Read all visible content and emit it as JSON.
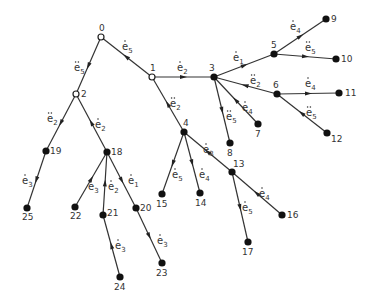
{
  "diagram": {
    "type": "tree",
    "nodes": [
      {
        "id": "0",
        "x": 101,
        "y": 37,
        "open": true,
        "lx": -2,
        "ly": -6
      },
      {
        "id": "1",
        "x": 152,
        "y": 77,
        "open": true,
        "lx": -2,
        "ly": -6
      },
      {
        "id": "2",
        "x": 76,
        "y": 94,
        "open": true,
        "lx": 5,
        "ly": 3
      },
      {
        "id": "3",
        "x": 214,
        "y": 77,
        "open": false,
        "lx": -5,
        "ly": -6
      },
      {
        "id": "4",
        "x": 184,
        "y": 132,
        "open": false,
        "lx": -1,
        "ly": -6
      },
      {
        "id": "5",
        "x": 274,
        "y": 54,
        "open": false,
        "lx": -3,
        "ly": -6
      },
      {
        "id": "6",
        "x": 277,
        "y": 94,
        "open": false,
        "lx": -4,
        "ly": -6
      },
      {
        "id": "7",
        "x": 258,
        "y": 124,
        "open": false,
        "lx": -3,
        "ly": 13
      },
      {
        "id": "8",
        "x": 230,
        "y": 143,
        "open": false,
        "lx": -3,
        "ly": 13
      },
      {
        "id": "9",
        "x": 326,
        "y": 19,
        "open": false,
        "lx": 5,
        "ly": 3
      },
      {
        "id": "10",
        "x": 336,
        "y": 59,
        "open": false,
        "lx": 5,
        "ly": 3
      },
      {
        "id": "11",
        "x": 339,
        "y": 93,
        "open": false,
        "lx": 6,
        "ly": 3
      },
      {
        "id": "12",
        "x": 327,
        "y": 133,
        "open": false,
        "lx": 4,
        "ly": 9
      },
      {
        "id": "13",
        "x": 232,
        "y": 172,
        "open": false,
        "lx": 1,
        "ly": -5
      },
      {
        "id": "14",
        "x": 200,
        "y": 193,
        "open": false,
        "lx": -5,
        "ly": 13
      },
      {
        "id": "15",
        "x": 162,
        "y": 194,
        "open": false,
        "lx": -6,
        "ly": 13
      },
      {
        "id": "16",
        "x": 282,
        "y": 215,
        "open": false,
        "lx": 5,
        "ly": 3
      },
      {
        "id": "17",
        "x": 248,
        "y": 242,
        "open": false,
        "lx": -6,
        "ly": 13
      },
      {
        "id": "18",
        "x": 107,
        "y": 152,
        "open": false,
        "lx": 4,
        "ly": 3
      },
      {
        "id": "19",
        "x": 46,
        "y": 151,
        "open": false,
        "lx": 4,
        "ly": 3
      },
      {
        "id": "20",
        "x": 136,
        "y": 208,
        "open": false,
        "lx": 4,
        "ly": 3
      },
      {
        "id": "21",
        "x": 103,
        "y": 215,
        "open": false,
        "lx": 4,
        "ly": 1
      },
      {
        "id": "22",
        "x": 75,
        "y": 207,
        "open": false,
        "lx": -5,
        "ly": 12
      },
      {
        "id": "23",
        "x": 162,
        "y": 263,
        "open": false,
        "lx": -6,
        "ly": 13
      },
      {
        "id": "24",
        "x": 120,
        "y": 277,
        "open": false,
        "lx": -6,
        "ly": 13
      },
      {
        "id": "25",
        "x": 27,
        "y": 208,
        "open": false,
        "lx": -5,
        "ly": 12
      }
    ],
    "edges": [
      {
        "from": "0",
        "to": "1",
        "label": "e",
        "dots": 1,
        "sub": "5",
        "arrow_toward": "from",
        "lx": 122,
        "ly": 50
      },
      {
        "from": "0",
        "to": "2",
        "label": "e",
        "dots": 2,
        "sub": "5",
        "arrow_toward": "to",
        "lx": 74,
        "ly": 71
      },
      {
        "from": "1",
        "to": "3",
        "label": "e",
        "dots": 1,
        "sub": "2",
        "arrow_toward": "to",
        "lx": 177,
        "ly": 71
      },
      {
        "from": "1",
        "to": "4",
        "label": "e",
        "dots": 2,
        "sub": "2",
        "arrow_toward": "from",
        "lx": 170,
        "ly": 107
      },
      {
        "from": "2",
        "to": "19",
        "label": "e",
        "dots": 2,
        "sub": "2",
        "arrow_toward": "to",
        "lx": 47,
        "ly": 122
      },
      {
        "from": "2",
        "to": "18",
        "label": "e",
        "dots": 1,
        "sub": "2",
        "arrow_toward": "from",
        "lx": 95,
        "ly": 128
      },
      {
        "from": "3",
        "to": "5",
        "label": "e",
        "dots": 1,
        "sub": "1",
        "arrow_toward": "to",
        "lx": 233,
        "ly": 61
      },
      {
        "from": "3",
        "to": "6",
        "label": "e",
        "dots": 2,
        "sub": "2",
        "arrow_toward": "from",
        "lx": 250,
        "ly": 84
      },
      {
        "from": "3",
        "to": "7",
        "label": "e",
        "dots": 1,
        "sub": "4",
        "arrow_toward": "from",
        "lx": 242,
        "ly": 111
      },
      {
        "from": "3",
        "to": "8",
        "label": "e",
        "dots": 2,
        "sub": "5",
        "arrow_toward": "to",
        "lx": 226,
        "ly": 120
      },
      {
        "from": "5",
        "to": "9",
        "label": "e",
        "dots": 1,
        "sub": "4",
        "arrow_toward": "to",
        "lx": 290,
        "ly": 30
      },
      {
        "from": "5",
        "to": "10",
        "label": "e",
        "dots": 2,
        "sub": "5",
        "arrow_toward": "to",
        "lx": 305,
        "ly": 51
      },
      {
        "from": "6",
        "to": "11",
        "label": "e",
        "dots": 1,
        "sub": "4",
        "arrow_toward": "to",
        "lx": 305,
        "ly": 87
      },
      {
        "from": "6",
        "to": "12",
        "label": "e",
        "dots": 2,
        "sub": "5",
        "arrow_toward": "from",
        "lx": 306,
        "ly": 116
      },
      {
        "from": "4",
        "to": "15",
        "label": "e",
        "dots": 1,
        "sub": "5",
        "arrow_toward": "to",
        "lx": 172,
        "ly": 178
      },
      {
        "from": "4",
        "to": "14",
        "label": "e",
        "dots": 1,
        "sub": "4",
        "arrow_toward": "to",
        "lx": 199,
        "ly": 178
      },
      {
        "from": "4",
        "to": "13",
        "label": "e",
        "dots": 1,
        "sub": "3",
        "arrow_toward": "from",
        "lx": 203,
        "ly": 153
      },
      {
        "from": "13",
        "to": "16",
        "label": "e",
        "dots": 1,
        "sub": "4",
        "arrow_toward": "from",
        "lx": 259,
        "ly": 197
      },
      {
        "from": "13",
        "to": "17",
        "label": "e",
        "dots": 1,
        "sub": "5",
        "arrow_toward": "to",
        "lx": 242,
        "ly": 211
      },
      {
        "from": "18",
        "to": "22",
        "label": "e",
        "dots": 1,
        "sub": "3",
        "arrow_toward": "from",
        "lx": 88,
        "ly": 190
      },
      {
        "from": "18",
        "to": "21",
        "label": "e",
        "dots": 1,
        "sub": "2",
        "arrow_toward": "from",
        "lx": 108,
        "ly": 190
      },
      {
        "from": "18",
        "to": "20",
        "label": "e",
        "dots": 1,
        "sub": "1",
        "arrow_toward": "to",
        "lx": 128,
        "ly": 184
      },
      {
        "from": "21",
        "to": "24",
        "label": "e",
        "dots": 1,
        "sub": "3",
        "arrow_toward": "from",
        "lx": 115,
        "ly": 249
      },
      {
        "from": "20",
        "to": "23",
        "label": "e",
        "dots": 1,
        "sub": "3",
        "arrow_toward": "to",
        "lx": 157,
        "ly": 244
      },
      {
        "from": "19",
        "to": "25",
        "label": "e",
        "dots": 1,
        "sub": "3",
        "arrow_toward": "to",
        "lx": 22,
        "ly": 184
      }
    ]
  }
}
